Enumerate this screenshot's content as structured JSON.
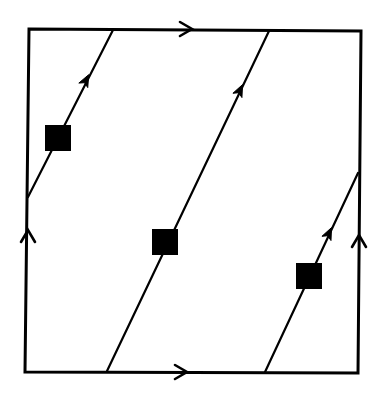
{
  "diagram": {
    "type": "torus-flow-square",
    "colors": {
      "background": "#ffffff",
      "ink": "#000000"
    },
    "square": {
      "tl": [
        29,
        29
      ],
      "tr": [
        361,
        31
      ],
      "br": [
        358,
        373
      ],
      "bl": [
        25,
        372
      ]
    },
    "edge_arrows": [
      {
        "name": "top-edge-arrow",
        "at": [
          190,
          29
        ],
        "direction": "right"
      },
      {
        "name": "bottom-edge-arrow",
        "at": [
          185,
          372
        ],
        "direction": "right"
      },
      {
        "name": "left-edge-arrow",
        "at": [
          28,
          232
        ],
        "direction": "up"
      },
      {
        "name": "right-edge-arrow",
        "at": [
          359,
          237
        ],
        "direction": "up"
      }
    ],
    "flow_lines": [
      {
        "name": "flow-line-a",
        "from": [
          28,
          197
        ],
        "to": [
          113,
          30
        ],
        "arrow_at": [
          86,
          80
        ],
        "marker": [
          58,
          138
        ]
      },
      {
        "name": "flow-line-b",
        "from": [
          107,
          371
        ],
        "to": [
          269,
          31
        ],
        "arrow_at": [
          240,
          90
        ],
        "marker": [
          165,
          242
        ]
      },
      {
        "name": "flow-line-c",
        "from": [
          265,
          372
        ],
        "to": [
          358,
          173
        ],
        "arrow_at": [
          329,
          233
        ],
        "marker": [
          309,
          276
        ]
      }
    ],
    "marker_size": 26
  }
}
